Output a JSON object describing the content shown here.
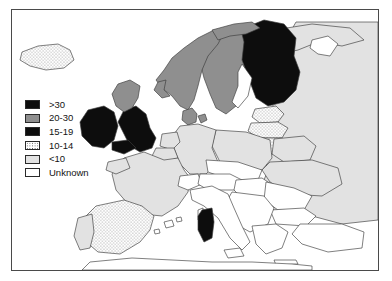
{
  "figure": {
    "type": "choropleth-map",
    "region": "Europe",
    "frame_border_color": "#4a4a4a",
    "background_color": "#ffffff"
  },
  "legend": {
    "name": "map-legend",
    "items": [
      {
        "label": ">30",
        "swatch": "black",
        "color": "#0d0d0d",
        "pattern": "solid"
      },
      {
        "label": "20-30",
        "swatch": "gray",
        "color": "#8f8f8f",
        "pattern": "solid"
      },
      {
        "label": "15-19",
        "swatch": "black",
        "color": "#0d0d0d",
        "pattern": "solid"
      },
      {
        "label": "10-14",
        "swatch": "stippled",
        "color": "#ffffff",
        "pattern": "dots"
      },
      {
        "label": "<10",
        "swatch": "light-gray",
        "color": "#e2e2e2",
        "pattern": "solid"
      },
      {
        "label": "Unknown",
        "swatch": "white",
        "color": "#ffffff",
        "pattern": "solid"
      }
    ]
  },
  "map_data": {
    "fill_classes": {
      "gt30": {
        "label": ">30",
        "fill": "#0d0d0d"
      },
      "c2030": {
        "label": "20-30",
        "fill": "#8f8f8f"
      },
      "c1519": {
        "label": "15-19",
        "fill": "#0d0d0d"
      },
      "c1014": {
        "label": "10-14",
        "fill": "url(#stipple)"
      },
      "lt10": {
        "label": "<10",
        "fill": "#e2e2e2"
      },
      "unk": {
        "label": "Unknown",
        "fill": "#ffffff"
      }
    },
    "countries": [
      {
        "name": "Iceland",
        "class": "c1014"
      },
      {
        "name": "Norway",
        "class": "c2030"
      },
      {
        "name": "Sweden",
        "class": "c2030"
      },
      {
        "name": "Finland",
        "class": "gt30"
      },
      {
        "name": "Denmark",
        "class": "c2030"
      },
      {
        "name": "Scotland",
        "class": "c2030"
      },
      {
        "name": "England-Wales",
        "class": "gt30"
      },
      {
        "name": "Ireland",
        "class": "gt30"
      },
      {
        "name": "Estonia",
        "class": "c1014"
      },
      {
        "name": "Latvia",
        "class": "c1014"
      },
      {
        "name": "Lithuania",
        "class": "c1014"
      },
      {
        "name": "Belarus",
        "class": "lt10"
      },
      {
        "name": "Russia",
        "class": "lt10"
      },
      {
        "name": "Poland",
        "class": "lt10"
      },
      {
        "name": "Germany",
        "class": "lt10"
      },
      {
        "name": "Netherlands",
        "class": "lt10"
      },
      {
        "name": "Belgium",
        "class": "lt10"
      },
      {
        "name": "France",
        "class": "lt10"
      },
      {
        "name": "Switzerland",
        "class": "unk"
      },
      {
        "name": "Austria",
        "class": "unk"
      },
      {
        "name": "Czech-Slovakia",
        "class": "unk"
      },
      {
        "name": "Hungary",
        "class": "unk"
      },
      {
        "name": "Ukraine",
        "class": "lt10"
      },
      {
        "name": "Romania",
        "class": "unk"
      },
      {
        "name": "Bulgaria",
        "class": "unk"
      },
      {
        "name": "Yugoslavia",
        "class": "unk"
      },
      {
        "name": "Greece",
        "class": "unk"
      },
      {
        "name": "Turkey",
        "class": "unk"
      },
      {
        "name": "Italy",
        "class": "unk"
      },
      {
        "name": "Sardinia",
        "class": "gt30"
      },
      {
        "name": "Sicily",
        "class": "unk"
      },
      {
        "name": "Spain",
        "class": "c1014"
      },
      {
        "name": "Portugal",
        "class": "lt10"
      },
      {
        "name": "Balearics",
        "class": "unk"
      },
      {
        "name": "Morocco-Algeria",
        "class": "unk"
      }
    ]
  }
}
